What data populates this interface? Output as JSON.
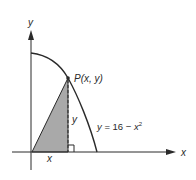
{
  "diagram": {
    "axes": {
      "x_label": "x",
      "y_label": "y"
    },
    "curve": {
      "equation_prefix": "y",
      "equation_mid": " = 16 − ",
      "equation_var": "x",
      "equation_exp": "2"
    },
    "point": {
      "name": "P",
      "coords": "(x, y)"
    },
    "segment_labels": {
      "horizontal": "x",
      "vertical": "y"
    },
    "colors": {
      "ink": "#2a2a2a",
      "shade": "#a9a9a9",
      "background": "#ffffff"
    }
  }
}
